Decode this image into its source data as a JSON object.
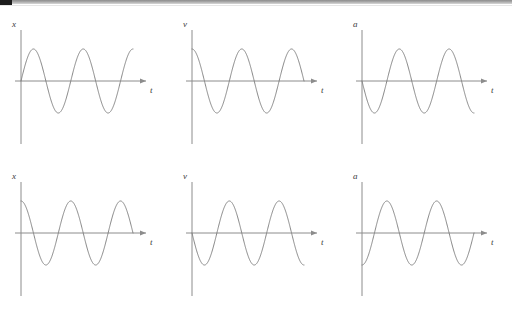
{
  "page": {
    "background_color": "#ffffff",
    "width": 512,
    "height": 318,
    "topbar": {
      "dark_color": "#1c1c1c",
      "light_color": "#a9a9a9"
    }
  },
  "style": {
    "axis_color": "#8c8c8c",
    "curve_color": "#7a7a7a",
    "label_color": "#3a3a3a"
  },
  "chart_data": [
    {
      "id": "graph-top-left",
      "type": "line",
      "title": "",
      "ylabel": "x",
      "xlabel": "t",
      "legend": "none",
      "grid": false,
      "axis_origin_label": "0",
      "function": "sin",
      "phase_description": "starts at zero, rises to positive maximum first",
      "amplitude": 1,
      "cycles": 2.25,
      "xlim": [
        0,
        2.25
      ],
      "ylim": [
        -1.15,
        1.15
      ],
      "x": [
        0,
        0.125,
        0.25,
        0.375,
        0.5,
        0.625,
        0.75,
        0.875,
        1.0,
        1.125,
        1.25,
        1.375,
        1.5,
        1.625,
        1.75,
        1.875,
        2.0,
        2.125,
        2.25
      ],
      "y": [
        0,
        0.707,
        1.0,
        0.707,
        0,
        -0.707,
        -1.0,
        -0.707,
        0,
        0.707,
        1.0,
        0.707,
        0,
        -0.707,
        -1.0,
        -0.707,
        0,
        0.707,
        1.0
      ]
    },
    {
      "id": "graph-top-middle",
      "type": "line",
      "title": "",
      "ylabel": "v",
      "xlabel": "t",
      "legend": "none",
      "grid": false,
      "function": "cos",
      "phase_description": "starts at positive maximum",
      "amplitude": 1,
      "cycles": 2.25,
      "xlim": [
        0,
        2.25
      ],
      "ylim": [
        -1.15,
        1.15
      ],
      "x": [
        0,
        0.125,
        0.25,
        0.375,
        0.5,
        0.625,
        0.75,
        0.875,
        1.0,
        1.125,
        1.25,
        1.375,
        1.5,
        1.625,
        1.75,
        1.875,
        2.0,
        2.125,
        2.25
      ],
      "y": [
        1.0,
        0.707,
        0,
        -0.707,
        -1.0,
        -0.707,
        0,
        0.707,
        1.0,
        0.707,
        0,
        -0.707,
        -1.0,
        -0.707,
        0,
        0.707,
        1.0,
        0.707,
        0
      ]
    },
    {
      "id": "graph-top-right",
      "type": "line",
      "title": "",
      "ylabel": "a",
      "xlabel": "t",
      "legend": "none",
      "grid": false,
      "function": "-sin",
      "phase_description": "starts at zero, falls to negative minimum first",
      "amplitude": 1,
      "cycles": 2.25,
      "xlim": [
        0,
        2.25
      ],
      "ylim": [
        -1.15,
        1.15
      ],
      "x": [
        0,
        0.125,
        0.25,
        0.375,
        0.5,
        0.625,
        0.75,
        0.875,
        1.0,
        1.125,
        1.25,
        1.375,
        1.5,
        1.625,
        1.75,
        1.875,
        2.0,
        2.125,
        2.25
      ],
      "y": [
        0,
        -0.707,
        -1.0,
        -0.707,
        0,
        0.707,
        1.0,
        0.707,
        0,
        -0.707,
        -1.0,
        -0.707,
        0,
        0.707,
        1.0,
        0.707,
        0,
        -0.707,
        -1.0
      ]
    },
    {
      "id": "graph-bottom-left",
      "type": "line",
      "title": "",
      "ylabel": "x",
      "xlabel": "t",
      "legend": "none",
      "grid": false,
      "function": "cos",
      "phase_description": "starts at positive maximum",
      "amplitude": 1,
      "cycles": 2.25,
      "xlim": [
        0,
        2.25
      ],
      "ylim": [
        -1.15,
        1.15
      ],
      "x": [
        0,
        0.125,
        0.25,
        0.375,
        0.5,
        0.625,
        0.75,
        0.875,
        1.0,
        1.125,
        1.25,
        1.375,
        1.5,
        1.625,
        1.75,
        1.875,
        2.0,
        2.125,
        2.25
      ],
      "y": [
        1.0,
        0.707,
        0,
        -0.707,
        -1.0,
        -0.707,
        0,
        0.707,
        1.0,
        0.707,
        0,
        -0.707,
        -1.0,
        -0.707,
        0,
        0.707,
        1.0,
        0.707,
        0
      ]
    },
    {
      "id": "graph-bottom-middle",
      "type": "line",
      "title": "",
      "ylabel": "v",
      "xlabel": "t",
      "legend": "none",
      "grid": false,
      "function": "-sin",
      "phase_description": "starts at zero, falls to negative minimum first",
      "amplitude": 1,
      "cycles": 2.25,
      "xlim": [
        0,
        2.25
      ],
      "ylim": [
        -1.15,
        1.15
      ],
      "x": [
        0,
        0.125,
        0.25,
        0.375,
        0.5,
        0.625,
        0.75,
        0.875,
        1.0,
        1.125,
        1.25,
        1.375,
        1.5,
        1.625,
        1.75,
        1.875,
        2.0,
        2.125,
        2.25
      ],
      "y": [
        0,
        -0.707,
        -1.0,
        -0.707,
        0,
        0.707,
        1.0,
        0.707,
        0,
        -0.707,
        -1.0,
        -0.707,
        0,
        0.707,
        1.0,
        0.707,
        0,
        -0.707,
        -1.0
      ]
    },
    {
      "id": "graph-bottom-right",
      "type": "line",
      "title": "",
      "ylabel": "a",
      "xlabel": "t",
      "legend": "none",
      "grid": false,
      "function": "-cos",
      "phase_description": "starts at negative minimum",
      "amplitude": 1,
      "cycles": 2.25,
      "xlim": [
        0,
        2.25
      ],
      "ylim": [
        -1.15,
        1.15
      ],
      "x": [
        0,
        0.125,
        0.25,
        0.375,
        0.5,
        0.625,
        0.75,
        0.875,
        1.0,
        1.125,
        1.25,
        1.375,
        1.5,
        1.625,
        1.75,
        1.875,
        2.0,
        2.125,
        2.25
      ],
      "y": [
        -1.0,
        -0.707,
        0,
        0.707,
        1.0,
        0.707,
        0,
        -0.707,
        -1.0,
        -0.707,
        0,
        0.707,
        1.0,
        0.707,
        0,
        -0.707,
        -1.0,
        -0.707,
        0
      ]
    }
  ]
}
